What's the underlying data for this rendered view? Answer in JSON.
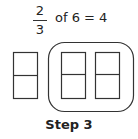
{
  "equation": {
    "numerator": "2",
    "denominator": "3",
    "rest": "of 6 = 4"
  },
  "diagram": {
    "total_items": 6,
    "boxes": [
      {
        "parts": 2,
        "grouped": false
      },
      {
        "parts": 2,
        "grouped": true
      },
      {
        "parts": 2,
        "grouped": true
      }
    ],
    "stroke_color": "#333333"
  },
  "caption": "Step 3"
}
